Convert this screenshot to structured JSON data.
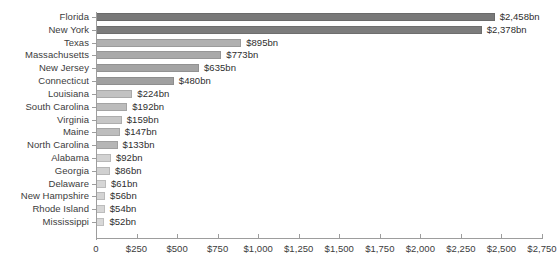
{
  "chart_data": {
    "type": "bar",
    "orientation": "horizontal",
    "title": "",
    "subtitle": "",
    "xlabel": "",
    "ylabel": "",
    "xlim": [
      0,
      2750
    ],
    "grid": false,
    "legend": null,
    "value_suffix": "bn",
    "value_prefix": "$",
    "categories": [
      "Florida",
      "New York",
      "Texas",
      "Massachusetts",
      "New Jersey",
      "Connecticut",
      "Louisiana",
      "South Carolina",
      "Virginia",
      "Maine",
      "North Carolina",
      "Alabama",
      "Georgia",
      "Delaware",
      "New Hampshire",
      "Rhode Island",
      "Mississippi"
    ],
    "values": [
      2458,
      2378,
      895,
      773,
      635,
      480,
      224,
      192,
      159,
      147,
      133,
      92,
      86,
      61,
      56,
      54,
      52
    ],
    "value_labels": [
      "$2,458bn",
      "$2,378bn",
      "$895bn",
      "$773bn",
      "$635bn",
      "$480bn",
      "$224bn",
      "$192bn",
      "$159bn",
      "$147bn",
      "$133bn",
      "$92bn",
      "$86bn",
      "$61bn",
      "$56bn",
      "$54bn",
      "$52bn"
    ],
    "bar_colors": [
      "#787878",
      "#7c7c7c",
      "#b0b0b0",
      "#a9a9a9",
      "#a4a4a4",
      "#a0a0a0",
      "#c2c2c2",
      "#bcbcbc",
      "#c6c6c6",
      "#bdbdbd",
      "#b6b6b6",
      "#d2d2d2",
      "#d0d0d0",
      "#d6d6d6",
      "#d4d4d4",
      "#d6d6d6",
      "#d8d8d8"
    ],
    "bar_border_colors": [
      "#6a6a6a",
      "#6e6e6e",
      "#9b9b9b",
      "#969696",
      "#929292",
      "#8e8e8e",
      "#a9a9a9",
      "#a4a4a4",
      "#adadad",
      "#a6a6a6",
      "#a0a0a0",
      "#b8b8b8",
      "#b6b6b6",
      "#bcbcbc",
      "#bababa",
      "#bcbcbc",
      "#bebebe"
    ],
    "xticks": [
      0,
      250,
      500,
      750,
      1000,
      1250,
      1500,
      1750,
      2000,
      2250,
      2500,
      2750
    ],
    "xtick_labels": [
      "0",
      "$250",
      "$500",
      "$750",
      "$1,000",
      "$1,250",
      "$1,500",
      "$1,750",
      "$2,000",
      "$2,250",
      "$2,500",
      "$2,750"
    ],
    "axis_color": "#9d9d9d",
    "text_color": "#3c3c3c",
    "background_color": "#ffffff"
  }
}
